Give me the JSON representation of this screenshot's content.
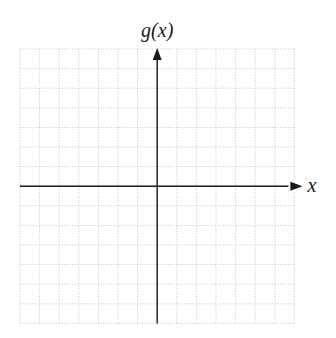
{
  "figure": {
    "y_axis_label": "g(x)",
    "x_axis_label": "x"
  },
  "colors": {
    "background": "#ffffff",
    "grid": "#b8b8b8",
    "axis": "#1a1a1a",
    "label": "#1a1a1a"
  },
  "grid": {
    "left": 20,
    "top": 49,
    "cell": 19.6,
    "cols": 14,
    "rows": 14,
    "origin_col": 7,
    "origin_row": 7
  },
  "chart_data": {
    "type": "line",
    "title": "",
    "xlabel": "x",
    "ylabel": "g(x)",
    "series": [],
    "grid": true,
    "grid_cells": {
      "columns": 14,
      "rows": 14
    },
    "x_grid_range": [
      -7,
      7
    ],
    "y_grid_range": [
      -7,
      7
    ],
    "x_axis_arrow": "positive",
    "y_axis_arrow": "positive",
    "tick_labels": [],
    "legend": null,
    "note": "Blank coordinate plane; no data plotted"
  }
}
